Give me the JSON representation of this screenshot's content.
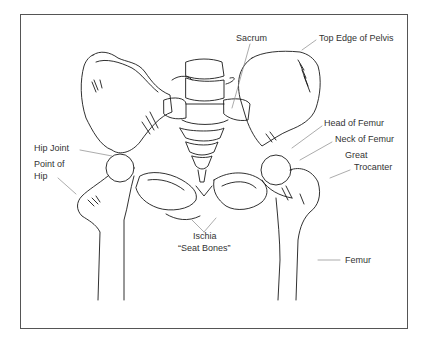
{
  "figure": {
    "labels": {
      "sacrum": "Sacrum",
      "top_edge_of_pelvis": "Top Edge of Pelvis",
      "head_of_femur": "Head of Femur",
      "neck_of_femur": "Neck of Femur",
      "great_trocanter_line1": "Great",
      "great_trocanter_line2": "Trocanter",
      "hip_joint": "Hip Joint",
      "point_of_hip_line1": "Point of",
      "point_of_hip_line2": "Hip",
      "ischia_line1": "Ischia",
      "ischia_line2": "“Seat Bones”",
      "femur": "Femur"
    },
    "colors": {
      "line": "#1a1a1a",
      "leader": "#888888",
      "frame": "#555555",
      "text": "#333333"
    }
  }
}
